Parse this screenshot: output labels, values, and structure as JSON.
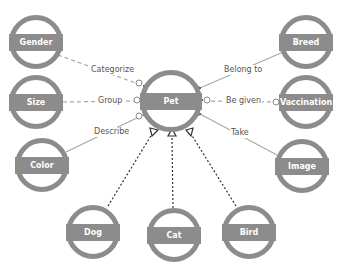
{
  "diagram": {
    "type": "entity-relationship",
    "center": {
      "id": "pet",
      "label": "Pet"
    },
    "nodes": [
      {
        "id": "gender",
        "label": "Gender",
        "x": 36,
        "y": 42,
        "r": 27
      },
      {
        "id": "size",
        "label": "Size",
        "x": 36,
        "y": 102,
        "r": 27
      },
      {
        "id": "color",
        "label": "Color",
        "x": 42,
        "y": 165,
        "r": 27
      },
      {
        "id": "pet",
        "label": "Pet",
        "x": 171,
        "y": 101,
        "r": 31
      },
      {
        "id": "breed",
        "label": "Breed",
        "x": 306,
        "y": 42,
        "r": 27
      },
      {
        "id": "vaccination",
        "label": "Vaccination",
        "x": 306,
        "y": 102,
        "r": 27
      },
      {
        "id": "image",
        "label": "Image",
        "x": 302,
        "y": 166,
        "r": 27
      },
      {
        "id": "dog",
        "label": "Dog",
        "x": 93,
        "y": 232,
        "r": 27
      },
      {
        "id": "cat",
        "label": "Cat",
        "x": 174,
        "y": 235,
        "r": 27
      },
      {
        "id": "bird",
        "label": "Bird",
        "x": 249,
        "y": 232,
        "r": 27
      }
    ],
    "relationships": [
      {
        "from": "gender",
        "to": "pet",
        "label": "Categorize",
        "style": "dashed"
      },
      {
        "from": "size",
        "to": "pet",
        "label": "Group",
        "style": "dashed"
      },
      {
        "from": "color",
        "to": "pet",
        "label": "Describe",
        "style": "solid"
      },
      {
        "from": "pet",
        "to": "breed",
        "label": "Belong to",
        "style": "solid"
      },
      {
        "from": "pet",
        "to": "vaccination",
        "label": "Be given",
        "style": "dashed"
      },
      {
        "from": "pet",
        "to": "image",
        "label": "Take",
        "style": "solid"
      },
      {
        "from": "dog",
        "to": "pet",
        "label": "",
        "style": "dotted-inheritance"
      },
      {
        "from": "cat",
        "to": "pet",
        "label": "",
        "style": "dotted-inheritance"
      },
      {
        "from": "bird",
        "to": "pet",
        "label": "",
        "style": "dotted-inheritance"
      }
    ],
    "colors": {
      "node": "#8c8c8c",
      "edge": "#a8a8a8",
      "inherit": "#333333",
      "text": "#555555"
    }
  }
}
